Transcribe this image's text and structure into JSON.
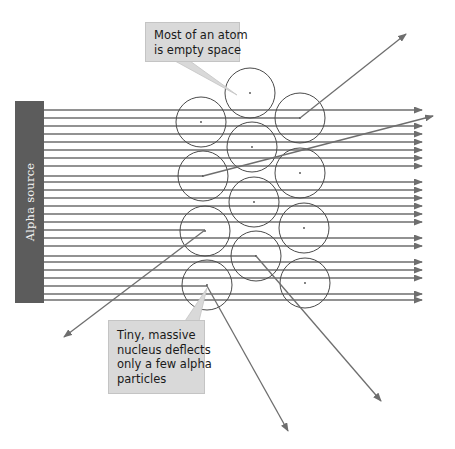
{
  "diagram": {
    "source": {
      "label": "Alpha source",
      "color": "#5c5c5c"
    },
    "callouts": [
      {
        "id": "empty-space",
        "lines": [
          "Most of an atom",
          "is empty space"
        ]
      },
      {
        "id": "nucleus",
        "lines": [
          "Tiny, massive",
          "nucleus deflects",
          "only a few alpha",
          "particles"
        ]
      }
    ],
    "colors": {
      "beam": "#6e6e6e",
      "circle": "#4a4a4a",
      "callout_fill": "#d9d9d9",
      "background": "#ffffff"
    },
    "beam": {
      "x_start": 44,
      "x_end": 422,
      "y_positions": [
        110,
        118,
        126,
        134,
        142,
        150,
        158,
        166,
        174,
        182,
        190,
        198,
        206,
        214,
        222,
        230,
        238,
        246,
        254,
        262,
        270,
        278,
        286,
        294,
        300
      ]
    },
    "atoms": [
      {
        "cx": 250,
        "cy": 93,
        "r": 25
      },
      {
        "cx": 201,
        "cy": 122,
        "r": 25
      },
      {
        "cx": 300,
        "cy": 118,
        "r": 25
      },
      {
        "cx": 252,
        "cy": 147,
        "r": 25
      },
      {
        "cx": 203,
        "cy": 176,
        "r": 25
      },
      {
        "cx": 300,
        "cy": 173,
        "r": 25
      },
      {
        "cx": 254,
        "cy": 202,
        "r": 25
      },
      {
        "cx": 205,
        "cy": 231,
        "r": 25
      },
      {
        "cx": 304,
        "cy": 228,
        "r": 25
      },
      {
        "cx": 256,
        "cy": 256,
        "r": 25
      },
      {
        "cx": 207,
        "cy": 285,
        "r": 25
      },
      {
        "cx": 305,
        "cy": 283,
        "r": 25
      }
    ],
    "deflections": [
      {
        "from": [
          300,
          118
        ],
        "to": [
          406,
          34
        ],
        "beam_y": 118
      },
      {
        "from": [
          203,
          176
        ],
        "to": [
          433,
          116
        ],
        "beam_y": 176
      },
      {
        "from": [
          205,
          230
        ],
        "to": [
          64,
          337
        ],
        "beam_y": 230
      },
      {
        "from": [
          256,
          256
        ],
        "to": [
          381,
          401
        ],
        "beam_y": 256
      },
      {
        "from": [
          207,
          286
        ],
        "to": [
          288,
          431
        ],
        "beam_y": 286
      }
    ]
  }
}
